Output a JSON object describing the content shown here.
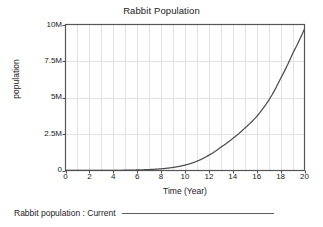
{
  "chart_data": {
    "type": "line",
    "title": "Rabbit Population",
    "xlabel": "Time (Year)",
    "ylabel": "population",
    "xlim": [
      0,
      20
    ],
    "ylim": [
      0,
      10000000
    ],
    "grid": true,
    "grid_x_step": 1,
    "legend_position": "below-plot",
    "x_tick_labels": [
      "0",
      "2",
      "4",
      "6",
      "8",
      "10",
      "12",
      "14",
      "16",
      "18",
      "20"
    ],
    "x_tick_values": [
      0,
      2,
      4,
      6,
      8,
      10,
      12,
      14,
      16,
      18,
      20
    ],
    "y_tick_labels": [
      "10M",
      "7.5M",
      "5M",
      "2.5M",
      "0"
    ],
    "y_tick_values": [
      10000000,
      7500000,
      5000000,
      2500000,
      0
    ],
    "series": [
      {
        "name": "Rabbit population : Current",
        "color": "#4d4d4d",
        "x": [
          0,
          1,
          2,
          3,
          4,
          5,
          6,
          7,
          8,
          9,
          10,
          11,
          12,
          13,
          14,
          15,
          16,
          17,
          18,
          19,
          20
        ],
        "values": [
          1000,
          1800,
          3300,
          6000,
          11000,
          20000,
          36000,
          65000,
          118000,
          210000,
          370000,
          640000,
          1050000,
          1600000,
          2200000,
          2900000,
          3700000,
          4800000,
          6300000,
          8000000,
          9700000
        ]
      }
    ]
  },
  "legend": {
    "label": "Rabbit population : Current"
  }
}
